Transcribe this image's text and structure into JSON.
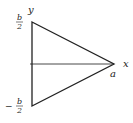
{
  "diagram": {
    "type": "triangle-with-axes",
    "labels": {
      "y_axis": "y",
      "x_axis": "x",
      "apex": "a",
      "top": {
        "numerator": "b",
        "denominator": "2",
        "sign": ""
      },
      "bottom": {
        "numerator": "b",
        "denominator": "2",
        "sign": "−"
      }
    },
    "colors": {
      "stroke": "#222222",
      "axis": "#333333",
      "background": "#ffffff"
    }
  }
}
